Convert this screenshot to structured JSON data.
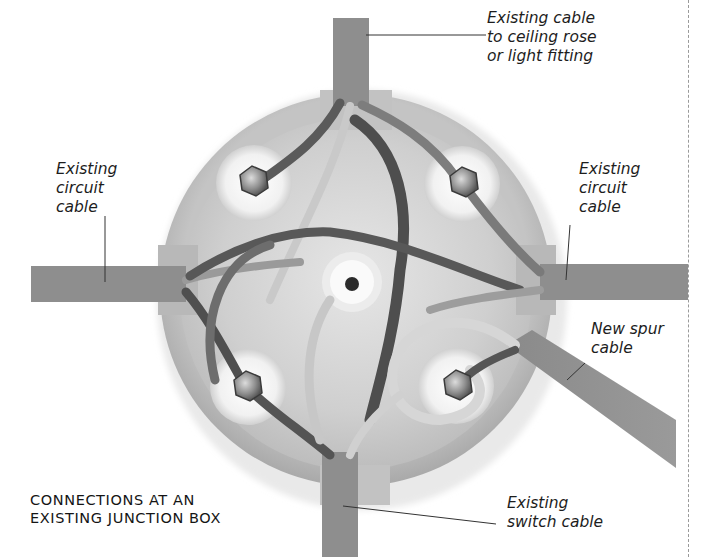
{
  "figure": {
    "caption_lines": [
      "CONNECTIONS AT AN",
      "EXISTING JUNCTION BOX"
    ],
    "colors": {
      "background": "#ffffff",
      "cable_sheath": "#8c8c8c",
      "box_body": "#d9d9d9",
      "terminal_pad": "#f4f4f4",
      "dark_wire": "#4a4a4a",
      "mid_wire": "#7a7a7a",
      "light_wire": "#cfcfcf",
      "leader_line": "#333333",
      "page_rule": "#9a9a9a"
    },
    "labels": {
      "top_right": {
        "lines": [
          "Existing cable",
          "to ceiling rose",
          "or light fitting"
        ]
      },
      "left": {
        "lines": [
          "Existing",
          "circuit",
          "cable"
        ]
      },
      "right": {
        "lines": [
          "Existing",
          "circuit",
          "cable"
        ]
      },
      "spur": {
        "lines": [
          "New spur",
          "cable"
        ]
      },
      "bottom_right": {
        "lines": [
          "Existing",
          "switch cable"
        ]
      }
    },
    "terminals": [
      {
        "name": "terminal-top-left"
      },
      {
        "name": "terminal-top-right"
      },
      {
        "name": "terminal-bottom-left"
      },
      {
        "name": "terminal-bottom-right"
      }
    ]
  }
}
